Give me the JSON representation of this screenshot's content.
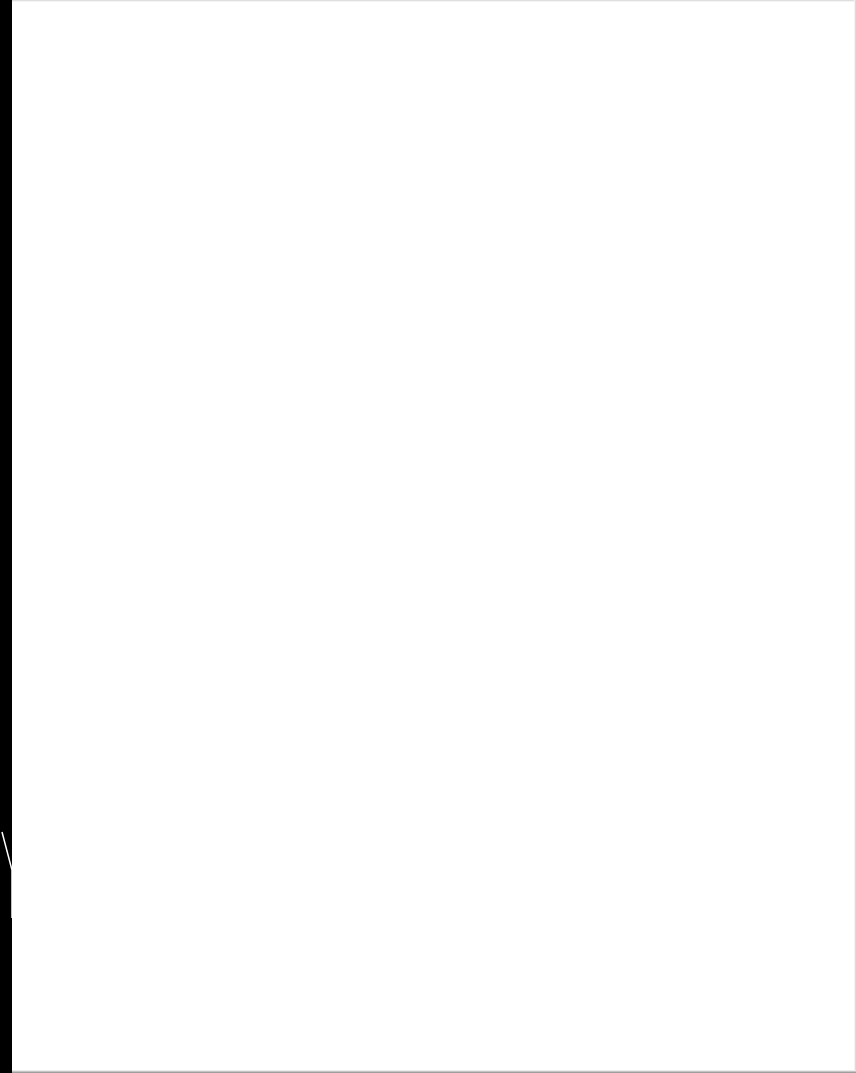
{
  "document": {
    "type": "scanned-page",
    "content": "",
    "page_color": "#ffffff",
    "border_color": "#000000"
  }
}
